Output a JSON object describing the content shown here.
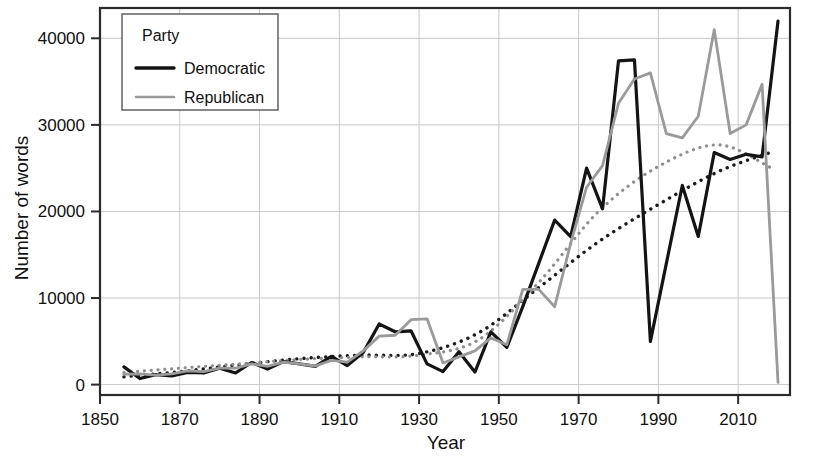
{
  "chart_data": {
    "type": "line",
    "title": "",
    "xlabel": "Year",
    "ylabel": "Number of words",
    "xlim": [
      1850,
      2023
    ],
    "ylim": [
      -1200,
      43500
    ],
    "xticks": [
      1850,
      1870,
      1890,
      1910,
      1930,
      1950,
      1970,
      1990,
      2010
    ],
    "xtick_labels": [
      "1850",
      "1870",
      "1890",
      "1910",
      "1930",
      "1950",
      "1970",
      "1990",
      "2010"
    ],
    "yticks": [
      0,
      10000,
      20000,
      30000,
      40000
    ],
    "ytick_labels": [
      "0",
      "10000",
      "20000",
      "30000",
      "40000"
    ],
    "grid": true,
    "legend": {
      "title": "Party",
      "position": "top-left-inside",
      "entries": [
        {
          "name": "Democratic",
          "color": "#141414",
          "style": "solid"
        },
        {
          "name": "Republican",
          "color": "#9a9a9a",
          "style": "solid"
        }
      ]
    },
    "series": [
      {
        "name": "Democratic",
        "color": "#141414",
        "width": 3.2,
        "style": "solid",
        "x": [
          1856,
          1860,
          1864,
          1868,
          1872,
          1876,
          1880,
          1884,
          1888,
          1892,
          1896,
          1900,
          1904,
          1908,
          1912,
          1916,
          1920,
          1924,
          1928,
          1932,
          1936,
          1940,
          1944,
          1948,
          1952,
          1956,
          1960,
          1964,
          1968,
          1972,
          1976,
          1980,
          1984,
          1988,
          1992,
          1996,
          2000,
          2004,
          2008,
          2012,
          2016,
          2020
        ],
        "y": [
          2050,
          700,
          1150,
          1000,
          1400,
          1350,
          1900,
          1350,
          2550,
          1800,
          2650,
          2400,
          2100,
          3250,
          2200,
          3700,
          7000,
          6100,
          6200,
          2400,
          1500,
          3800,
          1450,
          6100,
          4300,
          9000,
          14000,
          19000,
          17100,
          25000,
          20300,
          37400,
          37500,
          5000,
          14000,
          23000,
          17100,
          26800,
          26000,
          26600,
          26300,
          42000
        ]
      },
      {
        "name": "Republican",
        "color": "#9a9a9a",
        "width": 2.8,
        "style": "solid",
        "x": [
          1856,
          1860,
          1864,
          1868,
          1872,
          1876,
          1880,
          1884,
          1888,
          1892,
          1896,
          1900,
          1904,
          1908,
          1912,
          1916,
          1920,
          1924,
          1928,
          1932,
          1936,
          1940,
          1944,
          1948,
          1952,
          1956,
          1960,
          1964,
          1968,
          1972,
          1976,
          1980,
          1984,
          1988,
          1992,
          1996,
          2000,
          2004,
          2008,
          2012,
          2016,
          2020
        ],
        "y": [
          1200,
          1250,
          1100,
          1250,
          1600,
          1500,
          1900,
          1900,
          2400,
          2100,
          2600,
          2400,
          2150,
          2800,
          2600,
          3900,
          5600,
          5700,
          7500,
          7600,
          2500,
          3200,
          3900,
          5400,
          4600,
          11000,
          11000,
          9000,
          16300,
          22800,
          25300,
          32500,
          35300,
          36000,
          29000,
          28500,
          31000,
          41000,
          29000,
          30000,
          34700,
          250
        ]
      }
    ],
    "trend_lines": [
      {
        "name": "Democratic trend",
        "color": "#1c1c1c",
        "style": "dotted",
        "width": 3.4,
        "x": [
          1856,
          1870,
          1885,
          1900,
          1915,
          1930,
          1945,
          1960,
          1975,
          1990,
          2005,
          2018
        ],
        "y": [
          900,
          1500,
          2300,
          3000,
          3400,
          3600,
          6000,
          11200,
          16500,
          20800,
          24600,
          26800
        ]
      },
      {
        "name": "Republican trend",
        "color": "#8e8e8e",
        "style": "dotted",
        "width": 3.2,
        "x": [
          1856,
          1870,
          1885,
          1900,
          1915,
          1930,
          1945,
          1960,
          1975,
          1990,
          2005,
          2018
        ],
        "y": [
          1400,
          1900,
          2400,
          2900,
          3200,
          3400,
          5200,
          11800,
          20000,
          25200,
          27700,
          25100
        ]
      }
    ]
  }
}
